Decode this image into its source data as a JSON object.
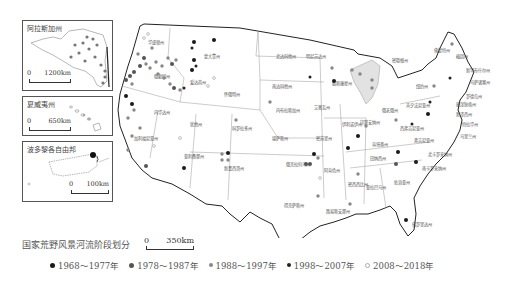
{
  "title": "国家荒野风景河流阶段划分",
  "main_scale": {
    "zero": "0",
    "distance": "350km"
  },
  "insets": [
    {
      "name": "alaska",
      "title": "阿拉斯加州",
      "scale_zero": "0",
      "scale_distance": "1200km"
    },
    {
      "name": "hawaii",
      "title": "夏威夷州",
      "scale_zero": "0",
      "scale_distance": "650km"
    },
    {
      "name": "puerto-rico",
      "title": "波多黎各自由邦",
      "scale_zero": "0",
      "scale_distance": "100km"
    }
  ],
  "legend": [
    {
      "label": "1968～1977年",
      "color": "#1a1a1a",
      "style": "large-black"
    },
    {
      "label": "1978～1987年",
      "color": "#555555",
      "style": "large-dark-gray"
    },
    {
      "label": "1988～1997年",
      "color": "#888888",
      "style": "medium-gray"
    },
    {
      "label": "1998～2007年",
      "color": "#222222",
      "style": "small-black"
    },
    {
      "label": "2008～2018年",
      "color": "#bbbbbb",
      "style": "light-gray-ring"
    }
  ],
  "states": [
    {
      "name": "华盛顿州",
      "x": 38,
      "y": 26
    },
    {
      "name": "蒙大拿州",
      "x": 94,
      "y": 40
    },
    {
      "name": "北达科他州",
      "x": 166,
      "y": 40
    },
    {
      "name": "明尼苏达州",
      "x": 196,
      "y": 40
    },
    {
      "name": "密歇根州",
      "x": 282,
      "y": 44
    },
    {
      "name": "缅因州",
      "x": 346,
      "y": 40
    },
    {
      "name": "佛蒙特州",
      "x": 324,
      "y": 34
    },
    {
      "name": "新罕布什尔州",
      "x": 356,
      "y": 54
    },
    {
      "name": "马萨诸塞州",
      "x": 360,
      "y": 66
    },
    {
      "name": "罗德岛州",
      "x": 356,
      "y": 80
    },
    {
      "name": "康涅狄格州",
      "x": 346,
      "y": 88
    },
    {
      "name": "新泽西州",
      "x": 346,
      "y": 98
    },
    {
      "name": "特拉华州",
      "x": 352,
      "y": 108
    },
    {
      "name": "马里兰州",
      "x": 350,
      "y": 120
    },
    {
      "name": "纽约州",
      "x": 306,
      "y": 70
    },
    {
      "name": "宾夕法尼亚州",
      "x": 296,
      "y": 89
    },
    {
      "name": "俄勒冈州",
      "x": 44,
      "y": 60
    },
    {
      "name": "爱达荷州",
      "x": 80,
      "y": 66
    },
    {
      "name": "怀俄明州",
      "x": 114,
      "y": 78
    },
    {
      "name": "南达科他州",
      "x": 162,
      "y": 70
    },
    {
      "name": "威斯康星州",
      "x": 222,
      "y": 67
    },
    {
      "name": "内华达州",
      "x": 44,
      "y": 96
    },
    {
      "name": "犹他州",
      "x": 80,
      "y": 108
    },
    {
      "name": "科罗拉多州",
      "x": 122,
      "y": 112
    },
    {
      "name": "内布拉斯加州",
      "x": 166,
      "y": 94
    },
    {
      "name": "艾奥瓦州",
      "x": 204,
      "y": 91
    },
    {
      "name": "伊利诺伊州",
      "x": 232,
      "y": 108
    },
    {
      "name": "印第安纳州",
      "x": 250,
      "y": 106
    },
    {
      "name": "俄亥俄州",
      "x": 272,
      "y": 94
    },
    {
      "name": "西弗吉尼亚州",
      "x": 290,
      "y": 112
    },
    {
      "name": "弗吉尼亚州",
      "x": 304,
      "y": 124
    },
    {
      "name": "加利福尼亚州",
      "x": 24,
      "y": 122
    },
    {
      "name": "堪萨斯州",
      "x": 162,
      "y": 122
    },
    {
      "name": "密苏里州",
      "x": 206,
      "y": 122
    },
    {
      "name": "肯塔基州",
      "x": 262,
      "y": 128
    },
    {
      "name": "北卡罗来纳州",
      "x": 318,
      "y": 138
    },
    {
      "name": "亚利桑那州",
      "x": 74,
      "y": 140
    },
    {
      "name": "新墨西哥州",
      "x": 114,
      "y": 152
    },
    {
      "name": "俄克拉何马州",
      "x": 176,
      "y": 148
    },
    {
      "name": "阿肯色州",
      "x": 214,
      "y": 154
    },
    {
      "name": "田纳西州",
      "x": 260,
      "y": 142
    },
    {
      "name": "南卡罗来纳州",
      "x": 312,
      "y": 152
    },
    {
      "name": "密西西比州",
      "x": 238,
      "y": 168
    },
    {
      "name": "亚拉巴马州",
      "x": 256,
      "y": 171
    },
    {
      "name": "佐治亚州",
      "x": 284,
      "y": 166
    },
    {
      "name": "得克萨斯州",
      "x": 174,
      "y": 189
    },
    {
      "name": "路易斯安那州",
      "x": 216,
      "y": 195
    },
    {
      "name": "佛罗里达州",
      "x": 302,
      "y": 208
    }
  ],
  "sites": [
    {
      "x": 34,
      "y": 20,
      "era": 4
    },
    {
      "x": 38,
      "y": 16,
      "era": 4
    },
    {
      "x": 42,
      "y": 30,
      "era": 2
    },
    {
      "x": 28,
      "y": 36,
      "era": 2
    },
    {
      "x": 34,
      "y": 40,
      "era": 1
    },
    {
      "x": 36,
      "y": 46,
      "era": 2
    },
    {
      "x": 30,
      "y": 48,
      "era": 1
    },
    {
      "x": 40,
      "y": 50,
      "era": 2
    },
    {
      "x": 46,
      "y": 44,
      "era": 2
    },
    {
      "x": 52,
      "y": 48,
      "era": 2
    },
    {
      "x": 58,
      "y": 40,
      "era": 2
    },
    {
      "x": 62,
      "y": 46,
      "era": 1
    },
    {
      "x": 66,
      "y": 42,
      "era": 2
    },
    {
      "x": 24,
      "y": 54,
      "era": 1
    },
    {
      "x": 20,
      "y": 58,
      "era": 1
    },
    {
      "x": 16,
      "y": 62,
      "era": 1
    },
    {
      "x": 22,
      "y": 66,
      "era": 2
    },
    {
      "x": 48,
      "y": 56,
      "era": 2
    },
    {
      "x": 54,
      "y": 60,
      "era": 2
    },
    {
      "x": 60,
      "y": 66,
      "era": 2
    },
    {
      "x": 64,
      "y": 70,
      "era": 1
    },
    {
      "x": 70,
      "y": 72,
      "era": 2
    },
    {
      "x": 74,
      "y": 70,
      "era": 3
    },
    {
      "x": 82,
      "y": 30,
      "era": 3
    },
    {
      "x": 84,
      "y": 42,
      "era": 0
    },
    {
      "x": 82,
      "y": 52,
      "era": 0
    },
    {
      "x": 86,
      "y": 48,
      "era": 3
    },
    {
      "x": 84,
      "y": 24,
      "era": 0
    },
    {
      "x": 104,
      "y": 22,
      "era": 0
    },
    {
      "x": 104,
      "y": 60,
      "era": 4
    },
    {
      "x": 98,
      "y": 68,
      "era": 4
    },
    {
      "x": 16,
      "y": 78,
      "era": 0
    },
    {
      "x": 22,
      "y": 86,
      "era": 0
    },
    {
      "x": 24,
      "y": 92,
      "era": 2
    },
    {
      "x": 18,
      "y": 100,
      "era": 2
    },
    {
      "x": 30,
      "y": 110,
      "era": 2
    },
    {
      "x": 22,
      "y": 118,
      "era": 2
    },
    {
      "x": 18,
      "y": 132,
      "era": 2
    },
    {
      "x": 36,
      "y": 148,
      "era": 1
    },
    {
      "x": 44,
      "y": 128,
      "era": 4
    },
    {
      "x": 70,
      "y": 120,
      "era": 4
    },
    {
      "x": 126,
      "y": 102,
      "era": 2
    },
    {
      "x": 160,
      "y": 84,
      "era": 2
    },
    {
      "x": 74,
      "y": 150,
      "era": 0
    },
    {
      "x": 112,
      "y": 136,
      "era": 2
    },
    {
      "x": 118,
      "y": 135,
      "era": 0
    },
    {
      "x": 112,
      "y": 142,
      "era": 2
    },
    {
      "x": 118,
      "y": 142,
      "era": 2
    },
    {
      "x": 204,
      "y": 136,
      "era": 0
    },
    {
      "x": 196,
      "y": 146,
      "era": 1
    },
    {
      "x": 200,
      "y": 146,
      "era": 1
    },
    {
      "x": 208,
      "y": 140,
      "era": 2
    },
    {
      "x": 210,
      "y": 160,
      "era": 4
    },
    {
      "x": 208,
      "y": 178,
      "era": 2
    },
    {
      "x": 238,
      "y": 130,
      "era": 0
    },
    {
      "x": 248,
      "y": 118,
      "era": 0
    },
    {
      "x": 256,
      "y": 108,
      "era": 2
    },
    {
      "x": 248,
      "y": 156,
      "era": 2
    },
    {
      "x": 240,
      "y": 186,
      "era": 2
    },
    {
      "x": 200,
      "y": 59,
      "era": 3
    },
    {
      "x": 224,
      "y": 63,
      "era": 0
    },
    {
      "x": 222,
      "y": 50,
      "era": 2
    },
    {
      "x": 242,
      "y": 52,
      "era": 2
    },
    {
      "x": 250,
      "y": 56,
      "era": 2
    },
    {
      "x": 262,
      "y": 62,
      "era": 2
    },
    {
      "x": 262,
      "y": 70,
      "era": 2
    },
    {
      "x": 288,
      "y": 134,
      "era": 0
    },
    {
      "x": 286,
      "y": 146,
      "era": 1
    },
    {
      "x": 306,
      "y": 144,
      "era": 0
    },
    {
      "x": 296,
      "y": 202,
      "era": 0
    },
    {
      "x": 342,
      "y": 26,
      "era": 2
    },
    {
      "x": 340,
      "y": 60,
      "era": 3
    },
    {
      "x": 324,
      "y": 68,
      "era": 2
    },
    {
      "x": 320,
      "y": 84,
      "era": 3
    },
    {
      "x": 318,
      "y": 96,
      "era": 0
    },
    {
      "x": 302,
      "y": 106,
      "era": 3
    },
    {
      "x": 286,
      "y": 102,
      "era": 2
    }
  ]
}
